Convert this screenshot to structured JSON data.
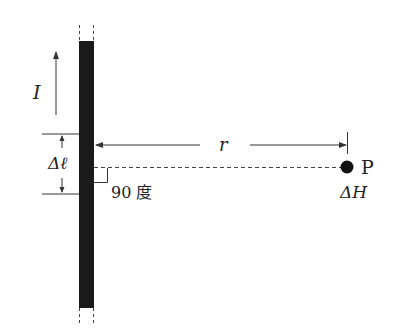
{
  "labels": {
    "current": "I",
    "segment": "Δℓ",
    "distance": "r",
    "angle": "90 度",
    "point": "P",
    "field": "ΔH"
  },
  "colors": {
    "wire": "#1a1a1a",
    "line": "#333333",
    "dot": "#111111"
  }
}
